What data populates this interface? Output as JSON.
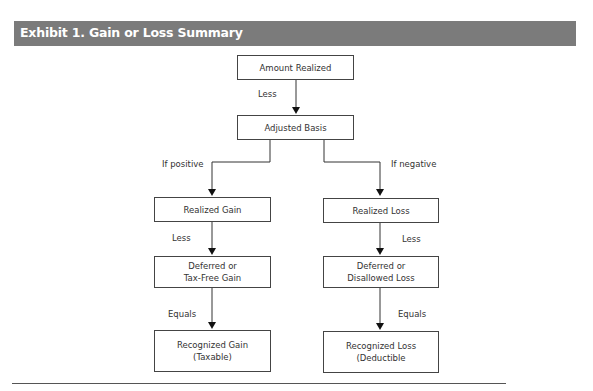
{
  "exhibit": {
    "title": "Exhibit 1. Gain or Loss Summary",
    "title_bar_color": "#7b7b7b"
  },
  "diagram": {
    "nodes": {
      "amount_realized": "Amount Realized",
      "adjusted_basis": "Adjusted Basis",
      "realized_gain": "Realized Gain",
      "realized_loss": "Realized Loss",
      "deferred_gain": "Deferred or\nTax-Free Gain",
      "deferred_loss": "Deferred or\nDisallowed Loss",
      "recognized_gain": "Recognized Gain\n(Taxable)",
      "recognized_loss": "Recognized Loss\n(Deductible"
    },
    "edge_labels": {
      "less_top": "Less",
      "if_positive": "If positive",
      "if_negative": "If negative",
      "less_gain": "Less",
      "less_loss": "Less",
      "equals_gain": "Equals",
      "equals_loss": "Equals"
    }
  }
}
